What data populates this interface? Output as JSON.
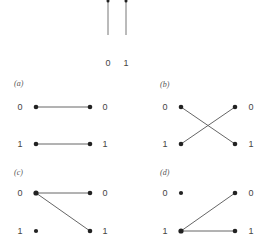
{
  "figure": {
    "top": {
      "wires": [
        {
          "label": "0",
          "x": 108
        },
        {
          "label": "1",
          "x": 126
        }
      ]
    },
    "panels": [
      {
        "id": "a",
        "label": "(a)",
        "left_labels": [
          "0",
          "1"
        ],
        "right_labels": [
          "0",
          "1"
        ],
        "edges": [
          [
            0,
            0
          ],
          [
            1,
            1
          ]
        ]
      },
      {
        "id": "b",
        "label": "(b)",
        "left_labels": [
          "0",
          "1"
        ],
        "right_labels": [
          "0",
          "1"
        ],
        "edges": [
          [
            0,
            1
          ],
          [
            1,
            0
          ]
        ]
      },
      {
        "id": "c",
        "label": "(c)",
        "left_labels": [
          "0",
          "1"
        ],
        "right_labels": [
          "0",
          "1"
        ],
        "edges": [
          [
            0,
            0
          ],
          [
            0,
            1
          ]
        ]
      },
      {
        "id": "d",
        "label": "(d)",
        "left_labels": [
          "0",
          "1"
        ],
        "right_labels": [
          "0",
          "1"
        ],
        "edges": [
          [
            1,
            0
          ],
          [
            1,
            1
          ]
        ]
      }
    ]
  },
  "colors": {
    "node": "#222222",
    "edge": "#666666",
    "text": "#444444"
  }
}
